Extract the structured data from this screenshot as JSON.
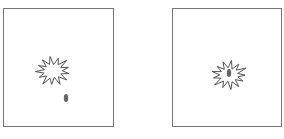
{
  "diagram": {
    "panels": [
      {
        "id": "panel-1",
        "description": "burst shape with separate oval below",
        "shapes": [
          {
            "type": "starburst",
            "style": "outline",
            "color": "#555555"
          },
          {
            "type": "oval",
            "style": "filled",
            "color": "#666666",
            "relation": "outside-below"
          }
        ]
      },
      {
        "id": "panel-2",
        "description": "burst shape containing oval",
        "shapes": [
          {
            "type": "starburst",
            "style": "outline",
            "color": "#555555"
          },
          {
            "type": "oval",
            "style": "filled",
            "color": "#666666",
            "relation": "inside"
          }
        ]
      }
    ],
    "colors": {
      "frame": "#777777",
      "outline": "#555555",
      "fill": "#666666",
      "background": "#ffffff"
    }
  }
}
